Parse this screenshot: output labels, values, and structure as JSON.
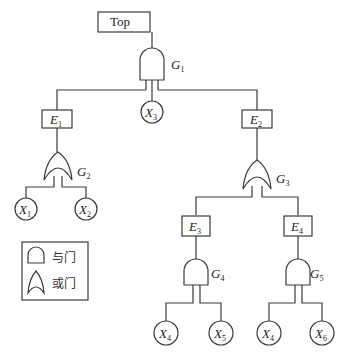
{
  "diagram": {
    "type": "fault-tree",
    "top_event": {
      "label": "Top"
    },
    "gates": [
      {
        "id": "G1",
        "letter": "G",
        "sub": "1",
        "type": "AND",
        "inputs": [
          "E1",
          "X3",
          "E2"
        ],
        "output": "Top"
      },
      {
        "id": "G2",
        "letter": "G",
        "sub": "2",
        "type": "OR",
        "inputs": [
          "X1",
          "X2"
        ],
        "output": "E1"
      },
      {
        "id": "G3",
        "letter": "G",
        "sub": "3",
        "type": "OR",
        "inputs": [
          "E3",
          "E4"
        ],
        "output": "E2"
      },
      {
        "id": "G4",
        "letter": "G",
        "sub": "4",
        "type": "AND",
        "inputs": [
          "X4",
          "X5"
        ],
        "output": "E3"
      },
      {
        "id": "G5",
        "letter": "G",
        "sub": "5",
        "type": "AND",
        "inputs": [
          "X4",
          "X6"
        ],
        "output": "E4"
      }
    ],
    "intermediate_events": [
      {
        "id": "E1",
        "letter": "E",
        "sub": "1"
      },
      {
        "id": "E2",
        "letter": "E",
        "sub": "2"
      },
      {
        "id": "E3",
        "letter": "E",
        "sub": "3"
      },
      {
        "id": "E4",
        "letter": "E",
        "sub": "4"
      }
    ],
    "basic_events": [
      {
        "id": "X1",
        "letter": "X",
        "sub": "1"
      },
      {
        "id": "X2",
        "letter": "X",
        "sub": "2"
      },
      {
        "id": "X3",
        "letter": "X",
        "sub": "3"
      },
      {
        "id": "X4a",
        "letter": "X",
        "sub": "4"
      },
      {
        "id": "X5",
        "letter": "X",
        "sub": "5"
      },
      {
        "id": "X4b",
        "letter": "X",
        "sub": "4"
      },
      {
        "id": "X6",
        "letter": "X",
        "sub": "6"
      }
    ]
  },
  "legend": {
    "items": [
      {
        "symbol": "and-gate",
        "label": "与门"
      },
      {
        "symbol": "or-gate",
        "label": "或门"
      }
    ]
  }
}
